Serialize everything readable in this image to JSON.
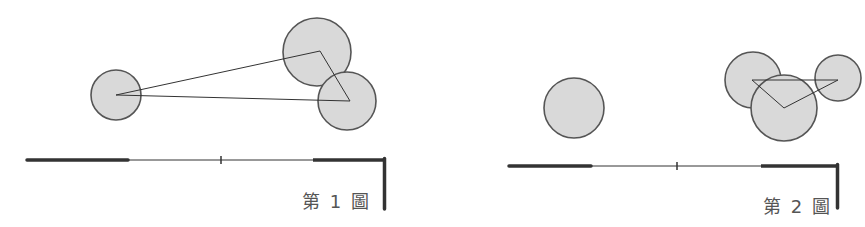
{
  "colors": {
    "circle_fill": "#d9d9d9",
    "circle_stroke": "#555555",
    "line_stroke": "#333333",
    "wall_stroke": "#333333",
    "label_color": "#555555",
    "background": "#ffffff"
  },
  "figures": [
    {
      "label": "第 1 圖",
      "circles": [
        {
          "cx": 116,
          "cy": 95,
          "r": 25
        },
        {
          "cx": 317,
          "cy": 52,
          "r": 34
        },
        {
          "cx": 347,
          "cy": 101,
          "r": 29
        }
      ],
      "triangle": [
        [
          116,
          95
        ],
        [
          320,
          51
        ],
        [
          350,
          101
        ]
      ],
      "wall": {
        "y": 160,
        "x_start": 27,
        "x_end": 386,
        "thick_left": [
          27,
          128
        ],
        "thick_right": [
          313,
          386
        ],
        "tick_x": 221,
        "corner_down_to": 209
      }
    },
    {
      "label": "第 2 圖",
      "circles": [
        {
          "cx": 574,
          "cy": 108,
          "r": 30
        },
        {
          "cx": 753,
          "cy": 80,
          "r": 28
        },
        {
          "cx": 784,
          "cy": 108,
          "r": 33
        },
        {
          "cx": 838,
          "cy": 78,
          "r": 23
        }
      ],
      "triangle": [
        [
          752,
          80
        ],
        [
          838,
          80
        ],
        [
          784,
          108
        ]
      ],
      "wall": {
        "y": 166,
        "x_start": 509,
        "x_end": 839,
        "thick_left": [
          509,
          591
        ],
        "thick_right": [
          761,
          839
        ],
        "tick_x": 677,
        "corner_down_to": 208
      }
    }
  ]
}
